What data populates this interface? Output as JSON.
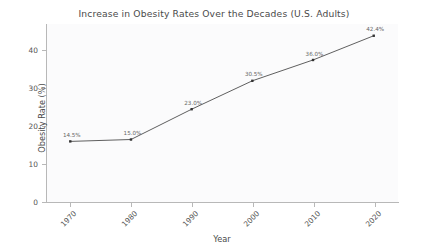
{
  "chart_data": {
    "type": "line",
    "title": "Increase in Obesity Rates Over the Decades (U.S. Adults)",
    "xlabel": "Year",
    "ylabel": "Obesity Rate (%)",
    "categories": [
      "1970",
      "1980",
      "1990",
      "2000",
      "2010",
      "2020"
    ],
    "x": [
      1970,
      1980,
      1990,
      2000,
      2010,
      2020
    ],
    "values": [
      14.5,
      15.0,
      23.0,
      30.5,
      36.0,
      42.4
    ],
    "point_labels": [
      "14.5%",
      "15.0%",
      "23.0%",
      "30.5%",
      "36.0%",
      "42.4%"
    ],
    "yticks": [
      0,
      10,
      20,
      30,
      40
    ],
    "ytick_labels": [
      "0",
      "10",
      "20",
      "30",
      "40"
    ],
    "xtick_labels": [
      "1970",
      "1980",
      "1990",
      "2000",
      "2010",
      "2020"
    ],
    "ylim": [
      -1.5,
      45.5
    ],
    "xlim": [
      1966,
      2024
    ],
    "grid": false,
    "legend": false,
    "series_name": "Obesity Rate",
    "line_color": "#4d4d4d",
    "marker": "square",
    "marker_color": "#333333",
    "plot_background": "#fbfbfc",
    "figure_background": "#ffffff"
  }
}
